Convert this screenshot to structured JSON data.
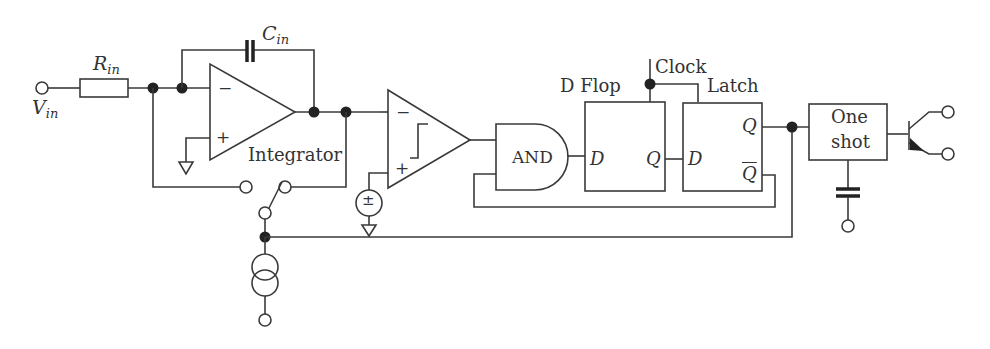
{
  "diagram": {
    "labels": {
      "vin_main": "V",
      "vin_sub": "in",
      "rin_main": "R",
      "rin_sub": "in",
      "cin_main": "C",
      "cin_sub": "in",
      "integrator": "Integrator",
      "integrator_minus": "−",
      "integrator_plus": "+",
      "comparator_minus": "−",
      "comparator_plus": "+",
      "and_gate": "AND",
      "dflop_title": "D Flop",
      "dflop_d": "D",
      "dflop_q": "Q",
      "clock": "Clock",
      "latch_title": "Latch",
      "latch_d": "D",
      "latch_q": "Q",
      "latch_qbar": "Q",
      "oneshot_line1": "One",
      "oneshot_line2": "shot"
    },
    "components": [
      {
        "id": "vin-terminal",
        "type": "terminal"
      },
      {
        "id": "rin",
        "type": "resistor"
      },
      {
        "id": "cin",
        "type": "capacitor"
      },
      {
        "id": "integrator",
        "type": "op-amp"
      },
      {
        "id": "reset-switch",
        "type": "switch"
      },
      {
        "id": "reference-source",
        "type": "dc-voltage-source"
      },
      {
        "id": "comparator",
        "type": "comparator"
      },
      {
        "id": "and-gate",
        "type": "logic-and"
      },
      {
        "id": "d-flop",
        "type": "d-flip-flop"
      },
      {
        "id": "latch",
        "type": "d-latch"
      },
      {
        "id": "one-shot",
        "type": "monostable"
      },
      {
        "id": "timing-capacitor",
        "type": "capacitor"
      },
      {
        "id": "output-transistor",
        "type": "npn-transistor"
      },
      {
        "id": "current-source",
        "type": "current-source"
      }
    ],
    "colors": {
      "stroke": "#3a3a3a",
      "junction": "#222222",
      "background": "#ffffff"
    }
  }
}
